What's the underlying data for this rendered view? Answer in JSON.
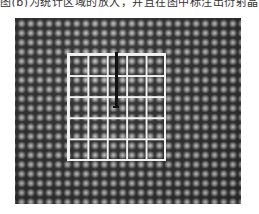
{
  "caption_fragment": "图(b)为统计区域的放大，并且在图中标注出衍射晶面",
  "figure": {
    "type": "high-resolution lattice micrograph",
    "overlay_grid": {
      "columns": 5,
      "rows": 5,
      "color": "#f2f2f2"
    },
    "marker": {
      "color": "#111111",
      "orientation": "vertical"
    }
  }
}
